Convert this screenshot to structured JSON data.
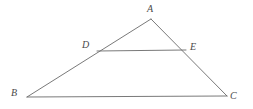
{
  "figure": {
    "type": "geometry-diagram",
    "background_color": "#ffffff",
    "stroke_color": "#6a6a6a",
    "label_color": "#4a4a4a",
    "stroke_width": 0.9,
    "points": {
      "A": {
        "label": "A",
        "x": 151,
        "y": 19,
        "label_x": 147,
        "label_y": 4
      },
      "B": {
        "label": "B",
        "x": 27,
        "y": 97,
        "label_x": 11,
        "label_y": 88
      },
      "C": {
        "label": "C",
        "x": 227,
        "y": 96,
        "label_x": 230,
        "label_y": 91
      },
      "D": {
        "label": "D",
        "x": 97,
        "y": 51,
        "label_x": 82,
        "label_y": 40
      },
      "E": {
        "label": "E",
        "x": 186,
        "y": 50,
        "label_x": 190,
        "label_y": 42
      }
    },
    "segments": [
      {
        "name": "side-AB",
        "from": "A",
        "to": "B"
      },
      {
        "name": "side-AC",
        "from": "A",
        "to": "C"
      },
      {
        "name": "base-BC",
        "from": "B",
        "to": "C"
      },
      {
        "name": "segment-DE",
        "from": "D",
        "to": "E"
      }
    ]
  }
}
